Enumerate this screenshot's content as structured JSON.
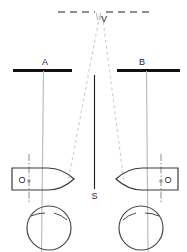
{
  "figure": {
    "type": "navigation-bearing-diagram",
    "background_color": "#ffffff",
    "width": 187,
    "height": 252
  },
  "colors": {
    "baseline_dark": "#111111",
    "sight_line_grey": "#b9b9b9",
    "dashed_grey": "#c9c9c9",
    "outline_dark": "#3a3a3a",
    "label_text": "#222222",
    "axis_dashdot": "#8a8a8a"
  },
  "labels": {
    "vertex": "V",
    "target_left": "A",
    "target_right": "B",
    "baseline_mid": "S",
    "observer_left": "O",
    "observer_right": "O"
  },
  "elements": {
    "top_dashed_line": {
      "name": "horizontal-dashed-reference-line",
      "y": 12,
      "x_start": 58,
      "x_end": 152,
      "style": "dashed"
    },
    "vertex_point": {
      "x": 101,
      "y": 14
    },
    "target_bar_left": {
      "name": "target-bar-a",
      "x_start": 13,
      "x_end": 72,
      "y": 70,
      "thickness": 3
    },
    "target_bar_right": {
      "name": "target-bar-b",
      "x_start": 117,
      "x_end": 180,
      "y": 70,
      "thickness": 3
    },
    "center_line": {
      "name": "center-baseline-s",
      "x": 94,
      "y_start": 75,
      "y_end": 189
    },
    "vessel_left": {
      "name": "vessel-left",
      "cx": 44,
      "cy": 179,
      "bow_direction": "right",
      "hull_width": 58,
      "hull_height": 22
    },
    "vessel_right": {
      "name": "vessel-right",
      "cx": 147,
      "cy": 179,
      "bow_direction": "left",
      "hull_width": 58,
      "hull_height": 22
    },
    "compass_left": {
      "name": "compass-rose-left",
      "cx": 49,
      "cy": 226,
      "r": 22
    },
    "compass_right": {
      "name": "compass-rose-right",
      "cx": 141,
      "cy": 226,
      "r": 22
    },
    "sight_line_left": {
      "from": [
        43,
        71
      ],
      "to": [
        44,
        252
      ]
    },
    "sight_line_right": {
      "from": [
        147,
        71
      ],
      "to": [
        143,
        252
      ]
    },
    "dashed_sight_left": {
      "from": [
        99,
        17
      ],
      "to": [
        68,
        181
      ]
    },
    "dashed_sight_right": {
      "from": [
        103,
        17
      ],
      "to": [
        124,
        181
      ]
    }
  }
}
